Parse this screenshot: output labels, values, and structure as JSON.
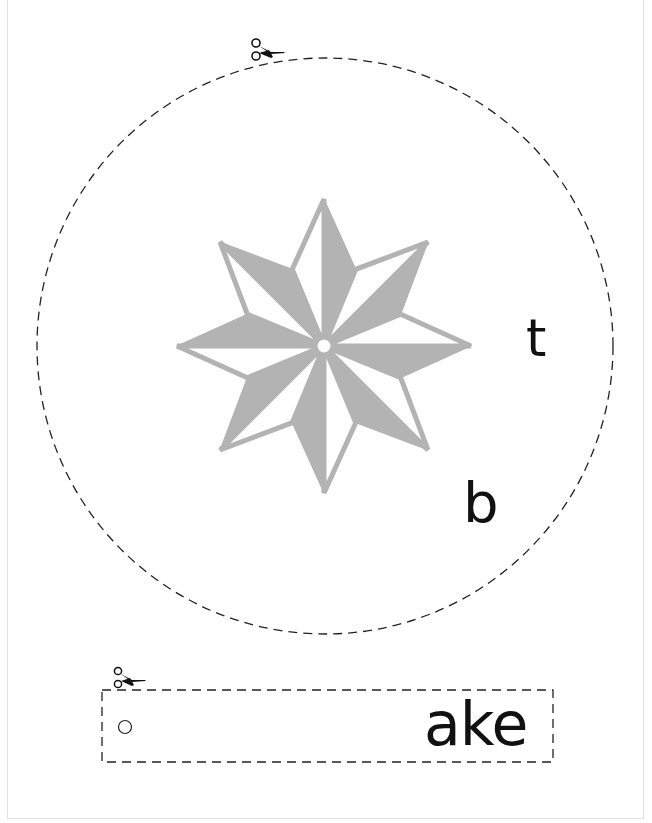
{
  "page": {
    "background": "#ffffff",
    "frame_color": "#e2e2e2"
  },
  "wheel": {
    "cut_line": {
      "shape": "dashed-circle",
      "center": [
        325,
        346
      ],
      "radius": 288,
      "color": "#222222"
    },
    "star": {
      "points": 8,
      "color": "#b3b3b3",
      "center": [
        324,
        346
      ],
      "outer_radius": 147,
      "inner_radius": 83
    },
    "letters": {
      "top_right": "t",
      "bottom_right": "b"
    }
  },
  "strip": {
    "word_ending": "ake",
    "cut_line": "dashed-rectangle",
    "pivot_hole": "circle"
  },
  "icons": {
    "scissors_wheel": "scissors-icon",
    "scissors_strip": "scissors-icon"
  }
}
